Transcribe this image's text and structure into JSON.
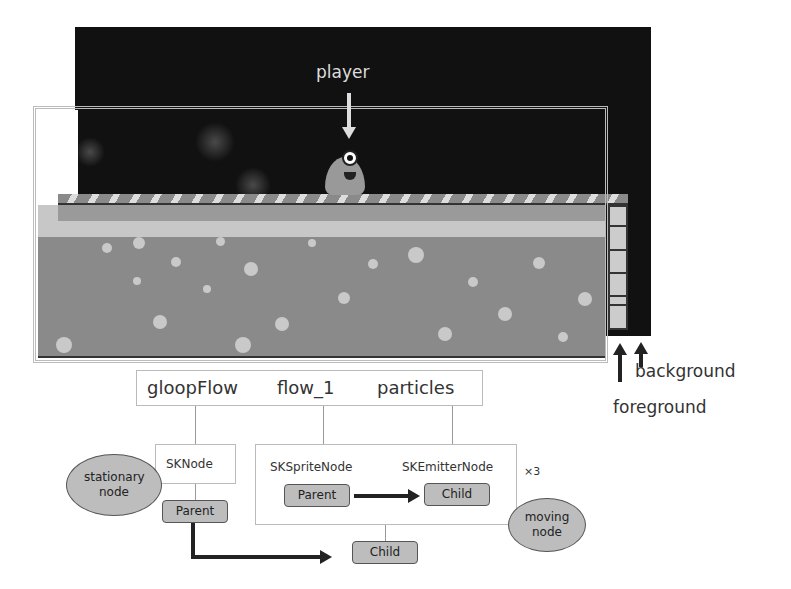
{
  "scene": {
    "player_label": "player",
    "layers": {
      "background_label": "background",
      "foreground_label": "foreground"
    }
  },
  "hierarchy": {
    "names": [
      "gloopFlow",
      "flow_1",
      "particles"
    ],
    "skNode": {
      "class_label": "SKNode",
      "parent_label": "Parent",
      "note": "stationary node"
    },
    "spriteGroup": {
      "sprite_class_label": "SKSpriteNode",
      "emitter_class_label": "SKEmitterNode",
      "parent_label": "Parent",
      "child_label": "Child",
      "multiplier": "×3",
      "note": "moving node"
    },
    "outer_child_label": "Child"
  },
  "colors": {
    "background_layer": "#111111",
    "liquid": "#8a8a8a",
    "pill": "#bdbdbd",
    "arrow": "#222222"
  }
}
